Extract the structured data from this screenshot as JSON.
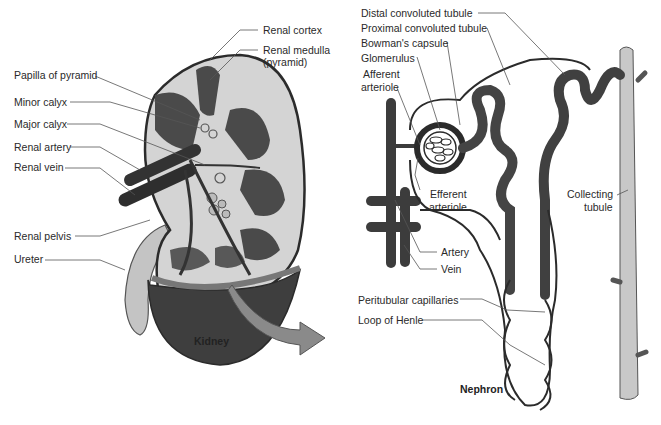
{
  "kidney": {
    "caption": "Kidney",
    "labels": {
      "renal_cortex": "Renal cortex",
      "renal_medulla": "Renal medulla",
      "renal_medulla_sub": "(pyramid)",
      "papilla": "Papilla of pyramid",
      "minor_calyx": "Minor calyx",
      "major_calyx": "Major calyx",
      "renal_artery": "Renal artery",
      "renal_vein": "Renal vein",
      "renal_pelvis": "Renal pelvis",
      "ureter": "Ureter"
    }
  },
  "nephron": {
    "caption": "Nephron",
    "labels": {
      "distal": "Distal convoluted tubule",
      "proximal": "Proximal convoluted tubule",
      "bowmans": "Bowman's capsule",
      "glomerulus": "Glomerulus",
      "afferent_1": "Afferent",
      "afferent_2": "arteriole",
      "efferent_1": "Efferent",
      "efferent_2": "arteriole",
      "collecting_1": "Collecting",
      "collecting_2": "tubule",
      "artery": "Artery",
      "vein": "Vein",
      "peritubular": "Peritubular capillaries",
      "loop_of_henle": "Loop of Henle"
    }
  },
  "colors": {
    "tissue_light": "#d4d4d4",
    "tissue_dark": "#4a4a4a",
    "outline": "#2b2b2b",
    "leader": "#555555",
    "collecting": "#c8c8c8"
  }
}
